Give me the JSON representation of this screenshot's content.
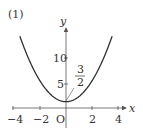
{
  "problem_label": "(1)",
  "chart_data": {
    "type": "line",
    "title": "",
    "function": "y = x^2 + 3/2",
    "xlabel": "x",
    "ylabel": "y",
    "origin_label": "O",
    "x_ticks": [
      -4,
      -2,
      2,
      4
    ],
    "x_tick_labels": [
      "−4",
      "−2",
      "2",
      "4"
    ],
    "y_ticks": [
      5,
      10
    ],
    "y_tick_labels": [
      "5",
      "10"
    ],
    "annotation": {
      "text_num": "3",
      "text_den": "2",
      "value": 1.5,
      "point": [
        0,
        1.5
      ]
    },
    "xlim": [
      -4.3,
      4.3
    ],
    "ylim": [
      0,
      18
    ],
    "grid": false,
    "series": [
      {
        "name": "parabola",
        "x": [
          -3.5,
          -3,
          -2,
          -1,
          0,
          1,
          2,
          3,
          3.5
        ],
        "values": [
          13.75,
          10.5,
          5.5,
          2.5,
          1.5,
          2.5,
          5.5,
          10.5,
          13.75
        ]
      }
    ],
    "colors": {
      "curve": "#333333",
      "axes": "#555555"
    }
  }
}
